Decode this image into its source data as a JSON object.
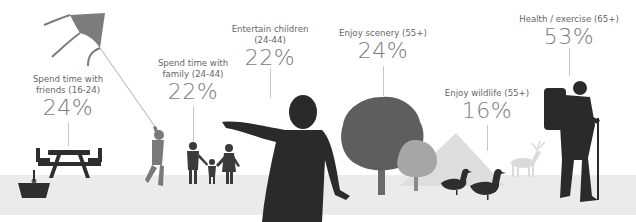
{
  "stats": [
    {
      "label_line1": "Spend time with",
      "label_line2": "friends (16-24)",
      "value": "24%"
    },
    {
      "label_line1": "Spend time with",
      "label_line2": "family (24-44)",
      "value": "22%"
    },
    {
      "label_line1": "Entertain children",
      "label_line2": "(24-44)",
      "value": "22%"
    },
    {
      "label_line1": "Enjoy scenery (55+)",
      "label_line2": "",
      "value": "24%"
    },
    {
      "label_line1": "Enjoy wildlife (55+)",
      "label_line2": "",
      "value": "16%"
    },
    {
      "label_line1": "Health / exercise (65+)",
      "label_line2": "",
      "value": "53%"
    }
  ],
  "illustrations": [
    "kite",
    "picnic-table",
    "picnic-basket",
    "child-with-kite",
    "family-holding-hands",
    "boy-silhouette",
    "tree",
    "small-tree",
    "mountain",
    "ducks",
    "deer",
    "hiker"
  ],
  "colors": {
    "text": "#666666",
    "value": "#7d7d7d",
    "ground": "#ebebeb",
    "dark": "#2b2b2b",
    "mid": "#5a5a5a",
    "light": "#a0a0a0",
    "faint": "#dcdcdc"
  }
}
